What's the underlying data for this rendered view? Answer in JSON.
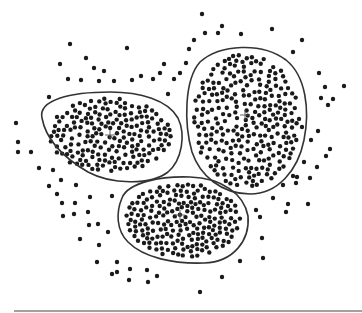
{
  "diagram": {
    "type": "cluster-scatter",
    "width": 362,
    "height": 313,
    "point_color": "#1a1a1a",
    "point_radius": 2.2,
    "boundary_color": "#333333",
    "centroid_color": "#555555",
    "baseline": {
      "x1": 14,
      "x2": 362,
      "y": 311,
      "color": "#444444"
    },
    "clusters": [
      {
        "id": "cluster-left",
        "centroid": [
          110,
          135
        ],
        "boundary_path": "M 42 118 C 38 100 70 92 110 92 C 140 92 168 100 178 118 C 186 135 182 160 168 172 C 150 186 110 184 88 172 C 64 158 46 140 42 118 Z",
        "fill_ellipse": {
          "cx": 110,
          "cy": 135,
          "rx": 64,
          "ry": 40
        },
        "point_count": 190,
        "seed": 11
      },
      {
        "id": "cluster-right",
        "centroid": [
          245,
          115
        ],
        "boundary_path": "M 200 62 C 220 44 262 42 286 60 C 306 76 310 110 304 140 C 298 170 278 194 250 194 C 222 194 200 176 192 152 C 184 124 184 80 200 62 Z",
        "fill_ellipse": {
          "cx": 246,
          "cy": 120,
          "rx": 56,
          "ry": 70
        },
        "point_count": 260,
        "seed": 23
      },
      {
        "id": "cluster-bottom",
        "centroid": [
          180,
          215
        ],
        "boundary_path": "M 122 198 C 128 182 162 176 190 177 C 222 178 244 194 248 216 C 250 240 234 262 204 263 C 174 264 144 258 128 242 C 116 230 116 212 122 198 Z",
        "fill_ellipse": {
          "cx": 183,
          "cy": 220,
          "rx": 60,
          "ry": 40
        },
        "point_count": 230,
        "seed": 37
      }
    ],
    "noise_points": [
      [
        70,
        44
      ],
      [
        127,
        48
      ],
      [
        86,
        58
      ],
      [
        60,
        64
      ],
      [
        94,
        68
      ],
      [
        104,
        71
      ],
      [
        160,
        73
      ],
      [
        141,
        76
      ],
      [
        180,
        73
      ],
      [
        68,
        79
      ],
      [
        81,
        80
      ],
      [
        99,
        81
      ],
      [
        114,
        81
      ],
      [
        132,
        80
      ],
      [
        153,
        79
      ],
      [
        174,
        79
      ],
      [
        168,
        94
      ],
      [
        164,
        64
      ],
      [
        189,
        49
      ],
      [
        186,
        63
      ],
      [
        194,
        40
      ],
      [
        202,
        14
      ],
      [
        205,
        33
      ],
      [
        218,
        33
      ],
      [
        222,
        26
      ],
      [
        241,
        34
      ],
      [
        272,
        29
      ],
      [
        293,
        52
      ],
      [
        302,
        40
      ],
      [
        319,
        73
      ],
      [
        325,
        87
      ],
      [
        344,
        86
      ],
      [
        321,
        98
      ],
      [
        333,
        99
      ],
      [
        302,
        127
      ],
      [
        318,
        131
      ],
      [
        326,
        156
      ],
      [
        304,
        162
      ],
      [
        317,
        167
      ],
      [
        297,
        177
      ],
      [
        308,
        204
      ],
      [
        296,
        183
      ],
      [
        49,
        97
      ],
      [
        16,
        123
      ],
      [
        18,
        142
      ],
      [
        18,
        152
      ],
      [
        31,
        152
      ],
      [
        39,
        168
      ],
      [
        53,
        170
      ],
      [
        49,
        186
      ],
      [
        61,
        180
      ],
      [
        76,
        185
      ],
      [
        57,
        194
      ],
      [
        62,
        203
      ],
      [
        75,
        203
      ],
      [
        63,
        216
      ],
      [
        74,
        214
      ],
      [
        88,
        212
      ],
      [
        90,
        197
      ],
      [
        112,
        196
      ],
      [
        89,
        225
      ],
      [
        98,
        224
      ],
      [
        108,
        232
      ],
      [
        80,
        239
      ],
      [
        99,
        245
      ],
      [
        97,
        262
      ],
      [
        117,
        262
      ],
      [
        117,
        272
      ],
      [
        130,
        269
      ],
      [
        112,
        274
      ],
      [
        147,
        270
      ],
      [
        129,
        280
      ],
      [
        148,
        282
      ],
      [
        157,
        276
      ],
      [
        200,
        292
      ],
      [
        222,
        277
      ],
      [
        240,
        261
      ],
      [
        262,
        238
      ],
      [
        260,
        217
      ],
      [
        273,
        198
      ],
      [
        283,
        185
      ],
      [
        256,
        210
      ],
      [
        263,
        258
      ],
      [
        286,
        212
      ],
      [
        288,
        204
      ],
      [
        310,
        178
      ],
      [
        293,
        176
      ],
      [
        311,
        140
      ],
      [
        328,
        105
      ],
      [
        330,
        149
      ]
    ]
  }
}
